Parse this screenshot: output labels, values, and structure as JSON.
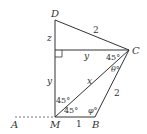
{
  "diagram": {
    "type": "geometry",
    "colors": {
      "line": "#333333",
      "background": "#ffffff"
    },
    "points": {
      "D": {
        "label": "D"
      },
      "C": {
        "label": "C"
      },
      "M": {
        "label": "M"
      },
      "B": {
        "label": "B"
      },
      "A": {
        "label": "A"
      }
    },
    "segment_labels": {
      "DC": "2",
      "foot_C": "y",
      "D_foot": "z",
      "foot_M": "y",
      "MC": "x",
      "BC": "2",
      "MB": "1"
    },
    "angle_labels": {
      "C_upper": "45°",
      "C_theta": "θ°",
      "M_upper": "45°",
      "M_lower": "45°",
      "B_phi": "φ°"
    }
  }
}
